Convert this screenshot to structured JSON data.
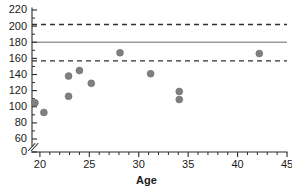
{
  "chart_data": {
    "type": "scatter",
    "title": "",
    "subtitle": "",
    "xlabel": "Age",
    "ylabel": "",
    "xlim": [
      19.2,
      45
    ],
    "ylim_display": [
      0,
      220
    ],
    "ylim_data": [
      55,
      220
    ],
    "axis_break": {
      "present": true,
      "between": [
        0,
        60
      ],
      "symbol": "double-slash"
    },
    "grid": false,
    "legend": null,
    "x_ticks": [
      20,
      25,
      30,
      35,
      40,
      45
    ],
    "x_tick_labels": [
      "20",
      "25",
      "30",
      "35",
      "40",
      "45"
    ],
    "x_minor_tick_step": 1,
    "y_ticks": [
      0,
      60,
      80,
      100,
      120,
      140,
      160,
      180,
      200,
      220
    ],
    "y_tick_labels": [
      "0",
      "60",
      "80",
      "100",
      "120",
      "140",
      "160",
      "180",
      "200",
      "220"
    ],
    "y_minor_tick_step": 10,
    "marker": {
      "shape": "circle",
      "color": "#7f7f7f",
      "size_px": 7
    },
    "reference_lines": [
      {
        "name": "upper-limit",
        "y": 202,
        "style": "dashed",
        "color": "#2f2f2f"
      },
      {
        "name": "mean",
        "y": 180,
        "style": "solid",
        "color": "#9a9a9a"
      },
      {
        "name": "lower-limit",
        "y": 157,
        "style": "dashed",
        "color": "#2f2f2f"
      }
    ],
    "points": [
      {
        "x": 19.5,
        "y": 105
      },
      {
        "x": 20.4,
        "y": 93
      },
      {
        "x": 22.9,
        "y": 113
      },
      {
        "x": 22.9,
        "y": 138
      },
      {
        "x": 24.0,
        "y": 145
      },
      {
        "x": 25.2,
        "y": 129
      },
      {
        "x": 28.1,
        "y": 167
      },
      {
        "x": 31.2,
        "y": 141
      },
      {
        "x": 34.1,
        "y": 109
      },
      {
        "x": 34.1,
        "y": 119
      },
      {
        "x": 42.2,
        "y": 166
      }
    ]
  }
}
